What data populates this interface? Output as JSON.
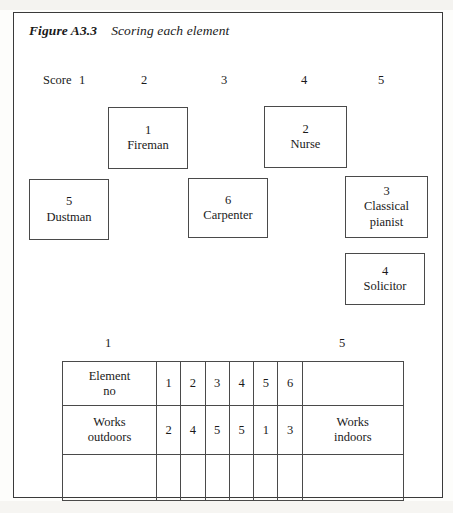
{
  "figure": {
    "label": "Figure A3.3",
    "title": "Scoring each element"
  },
  "score_scale": {
    "caption": "Score",
    "ticks": [
      "1",
      "2",
      "3",
      "4",
      "5"
    ]
  },
  "elements": [
    {
      "number": "1",
      "name": "Fireman"
    },
    {
      "number": "2",
      "name": "Nurse"
    },
    {
      "number": "5",
      "name": "Dustman"
    },
    {
      "number": "6",
      "name": "Carpenter"
    },
    {
      "number": "3",
      "name": "Classical\npianist"
    },
    {
      "number": "4",
      "name": "Solicitor"
    }
  ],
  "grid_scale": {
    "left_tick": "1",
    "right_tick": "5"
  },
  "rating_grid": {
    "element_row": {
      "left_pole": "Element\nno",
      "cells": [
        "1",
        "2",
        "3",
        "4",
        "5",
        "6"
      ],
      "right_pole": ""
    },
    "construct_row": {
      "left_pole": "Works\noutdoors",
      "cells": [
        "2",
        "4",
        "5",
        "5",
        "1",
        "3"
      ],
      "right_pole": "Works\nindoors"
    },
    "empty_row": {
      "left_pole": "",
      "cells": [
        "",
        "",
        "",
        "",
        "",
        ""
      ],
      "right_pole": ""
    }
  }
}
